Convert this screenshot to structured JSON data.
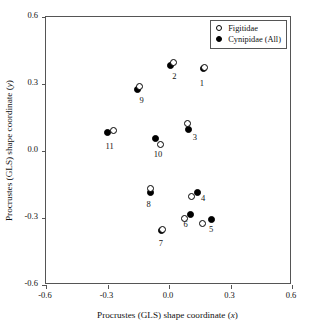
{
  "chart_data": {
    "type": "scatter",
    "title": "",
    "xlabel": "Procrustes (GLS) shape coordinate (x)",
    "ylabel": "Procrustes (GLS) shape coordinate (y)",
    "xlim": [
      -0.6,
      0.6
    ],
    "ylim": [
      -0.6,
      0.6
    ],
    "xticks": [
      "-0.6",
      "-0.3",
      "0.0",
      "0.3",
      "0.6"
    ],
    "xtick_values": [
      -0.6,
      -0.3,
      0.0,
      0.3,
      0.6
    ],
    "yticks": [
      "0.6",
      "0.3",
      "0.0",
      "-0.3",
      "-0.6"
    ],
    "ytick_values": [
      0.6,
      0.3,
      0.0,
      -0.3,
      -0.6
    ],
    "grid": false,
    "legend_position": "top-right",
    "series": [
      {
        "name": "Figitidae",
        "marker": "open-circle",
        "color": "#000000",
        "points": [
          {
            "label": "1",
            "x": 0.175,
            "y": 0.375
          },
          {
            "label": "2",
            "x": 0.02,
            "y": 0.395
          },
          {
            "label": "3",
            "x": 0.09,
            "y": 0.125
          },
          {
            "label": "4",
            "x": 0.11,
            "y": -0.205
          },
          {
            "label": "5",
            "x": 0.165,
            "y": -0.325
          },
          {
            "label": "6",
            "x": 0.075,
            "y": -0.3
          },
          {
            "label": "7",
            "x": -0.03,
            "y": -0.35
          },
          {
            "label": "8",
            "x": -0.09,
            "y": -0.17
          },
          {
            "label": "9",
            "x": -0.145,
            "y": 0.29
          },
          {
            "label": "10",
            "x": -0.04,
            "y": 0.03
          },
          {
            "label": "11",
            "x": -0.27,
            "y": 0.09
          }
        ]
      },
      {
        "name": "Cynipidae (All)",
        "marker": "filled-circle",
        "color": "#000000",
        "points": [
          {
            "label": "1",
            "x": 0.17,
            "y": 0.37
          },
          {
            "label": "2",
            "x": 0.005,
            "y": 0.385
          },
          {
            "label": "3",
            "x": 0.095,
            "y": 0.095
          },
          {
            "label": "4",
            "x": 0.14,
            "y": -0.185
          },
          {
            "label": "5",
            "x": 0.205,
            "y": -0.305
          },
          {
            "label": "6",
            "x": 0.105,
            "y": -0.285
          },
          {
            "label": "7",
            "x": -0.035,
            "y": -0.355
          },
          {
            "label": "8",
            "x": -0.09,
            "y": -0.185
          },
          {
            "label": "9",
            "x": -0.155,
            "y": 0.275
          },
          {
            "label": "10",
            "x": -0.065,
            "y": 0.055
          },
          {
            "label": "11",
            "x": -0.3,
            "y": 0.085
          }
        ]
      }
    ],
    "point_labels": [
      {
        "text": "1",
        "near_x": 0.17,
        "near_y": 0.3
      },
      {
        "text": "2",
        "near_x": 0.035,
        "near_y": 0.33
      },
      {
        "text": "3",
        "near_x": 0.135,
        "near_y": 0.06
      },
      {
        "text": "4",
        "near_x": 0.175,
        "near_y": -0.215
      },
      {
        "text": "5",
        "near_x": 0.215,
        "near_y": -0.355
      },
      {
        "text": "6",
        "near_x": 0.09,
        "near_y": -0.33
      },
      {
        "text": "7",
        "near_x": -0.03,
        "near_y": -0.415
      },
      {
        "text": "8",
        "near_x": -0.09,
        "near_y": -0.24
      },
      {
        "text": "9",
        "near_x": -0.125,
        "near_y": 0.225
      },
      {
        "text": "10",
        "near_x": -0.055,
        "near_y": -0.02
      },
      {
        "text": "11",
        "near_x": -0.29,
        "near_y": 0.02
      }
    ]
  },
  "legend": {
    "items": [
      {
        "label": "Figitidae",
        "marker": "open-circle"
      },
      {
        "label": "Cynipidae (All)",
        "marker": "filled-circle"
      }
    ]
  }
}
